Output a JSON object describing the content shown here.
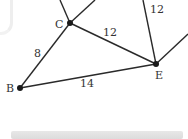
{
  "diagram": {
    "type": "weighted-graph",
    "nodes": [
      {
        "id": "C",
        "label": "C",
        "x": 70,
        "y": 23
      },
      {
        "id": "E",
        "label": "E",
        "x": 156,
        "y": 64
      },
      {
        "id": "B",
        "label": "B",
        "x": 20,
        "y": 88
      }
    ],
    "edges": [
      {
        "from": "B",
        "to": "C",
        "weight": "8"
      },
      {
        "from": "C",
        "to": "E",
        "weight": "12"
      },
      {
        "from": "B",
        "to": "E",
        "weight": "14"
      },
      {
        "from": "E",
        "to": "offscreen-top",
        "weight": "12"
      },
      {
        "from": "C",
        "to": "offscreen-top-left",
        "weight": ""
      },
      {
        "from": "C",
        "to": "offscreen-top-right",
        "weight": ""
      },
      {
        "from": "E",
        "to": "offscreen-right",
        "weight": ""
      }
    ],
    "labels": {
      "node_c": "C",
      "node_e": "E",
      "node_b": "B",
      "edge_bc": "8",
      "edge_ce": "12",
      "edge_be": "14",
      "edge_e_top": "12"
    },
    "colors": {
      "edge": "#2a2a2a",
      "node": "#1a1a1a",
      "text": "#333333"
    }
  }
}
